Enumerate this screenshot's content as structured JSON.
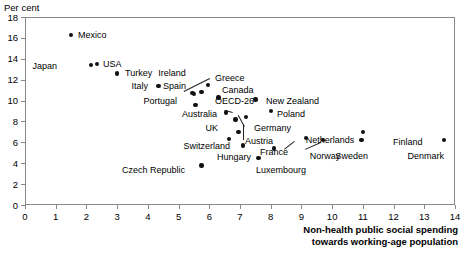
{
  "chart_data": {
    "type": "scatter",
    "title": "",
    "ylabel": "Per cent",
    "xlabel": "Non-health public social spending towards working-age population",
    "xlabel_line1": "Non-health public social spending",
    "xlabel_line2": "towards working-age population",
    "xlim": [
      0,
      14
    ],
    "ylim": [
      0,
      18
    ],
    "xticks": [
      0,
      1,
      2,
      3,
      4,
      5,
      6,
      7,
      8,
      9,
      10,
      11,
      12,
      13,
      14
    ],
    "yticks": [
      0,
      2,
      4,
      6,
      8,
      10,
      12,
      14,
      16,
      18
    ],
    "grid": false,
    "legend": "none",
    "marker_color": "#111111",
    "frame_color": "#888888",
    "points": [
      {
        "label": "Mexico",
        "x": 1.5,
        "y": 16.3,
        "lx": 78,
        "ly": 31,
        "align": "left"
      },
      {
        "label": "Japan",
        "x": 2.15,
        "y": 13.4,
        "lx": 57,
        "ly": 62,
        "align": "right"
      },
      {
        "label": "USA",
        "x": 2.35,
        "y": 13.5,
        "lx": 103,
        "ly": 60,
        "align": "left"
      },
      {
        "label": "Turkey",
        "x": 3.0,
        "y": 12.6,
        "lx": 125,
        "ly": 69,
        "align": "left"
      },
      {
        "label": "Italy",
        "x": 4.35,
        "y": 11.4,
        "lx": 148,
        "ly": 82,
        "align": "right"
      },
      {
        "label": "Ireland",
        "x": 5.45,
        "y": 10.7,
        "lx": 172,
        "ly": 69,
        "align": "center"
      },
      {
        "label": "Spain",
        "x": 5.5,
        "y": 10.6,
        "lx": 186,
        "ly": 82,
        "align": "right"
      },
      {
        "label": "Greece",
        "x": 5.95,
        "y": 11.5,
        "lx": 215,
        "ly": 74,
        "align": "left"
      },
      {
        "label": "Canada",
        "x": 5.75,
        "y": 10.8,
        "lx": 222,
        "ly": 86,
        "align": "left"
      },
      {
        "label": "Portugal",
        "x": 5.55,
        "y": 9.55,
        "lx": 177,
        "ly": 97,
        "align": "right"
      },
      {
        "label": "OECD-26",
        "x": 6.3,
        "y": 10.3,
        "lx": 215,
        "ly": 97,
        "align": "left"
      },
      {
        "label": "Australia",
        "x": 6.55,
        "y": 8.85,
        "lx": 217,
        "ly": 110,
        "align": "right"
      },
      {
        "label": "New Zealand",
        "x": 7.5,
        "y": 10.1,
        "lx": 266,
        "ly": 97,
        "align": "left"
      },
      {
        "label": "Poland",
        "x": 8.0,
        "y": 9.0,
        "lx": 277,
        "ly": 110,
        "align": "left"
      },
      {
        "label": "UK",
        "x": 6.85,
        "y": 8.2,
        "lx": 218,
        "ly": 124,
        "align": "right"
      },
      {
        "label": "Germany",
        "x": 7.2,
        "y": 8.45,
        "lx": 254,
        "ly": 124,
        "align": "left"
      },
      {
        "label": "Austria",
        "x": 6.95,
        "y": 7.0,
        "lx": 245,
        "ly": 137,
        "align": "left"
      },
      {
        "label": "Switzerland",
        "x": 6.65,
        "y": 6.3,
        "lx": 230,
        "ly": 142,
        "align": "right"
      },
      {
        "label": "Hungary",
        "x": 7.1,
        "y": 5.7,
        "lx": 251,
        "ly": 153,
        "align": "right"
      },
      {
        "label": "France",
        "x": 8.1,
        "y": 5.4,
        "lx": 274,
        "ly": 148,
        "align": "center"
      },
      {
        "label": "Netherlands",
        "x": 9.15,
        "y": 6.4,
        "lx": 330,
        "ly": 136,
        "align": "center"
      },
      {
        "label": "Norway",
        "x": 9.7,
        "y": 6.2,
        "lx": 325,
        "ly": 152,
        "align": "center"
      },
      {
        "label": "Sweden",
        "x": 10.95,
        "y": 6.2,
        "lx": 368,
        "ly": 152,
        "align": "right"
      },
      {
        "label": "Finland",
        "x": 11.0,
        "y": 7.0,
        "lx": 393,
        "ly": 138,
        "align": "left"
      },
      {
        "label": "Denmark",
        "x": 13.65,
        "y": 6.2,
        "lx": 444,
        "ly": 152,
        "align": "right"
      },
      {
        "label": "Luxembourg",
        "x": 7.6,
        "y": 4.5,
        "lx": 281,
        "ly": 166,
        "align": "center"
      },
      {
        "label": "Czech Republic",
        "x": 5.75,
        "y": 3.8,
        "lx": 185,
        "ly": 166,
        "align": "right"
      }
    ],
    "leaders": [
      {
        "from_x": 210,
        "from_y": 79,
        "to_x": 184,
        "to_y": 92
      },
      {
        "from_x": 244,
        "from_y": 127,
        "to_x": 238,
        "to_y": 116
      },
      {
        "from_x": 243,
        "from_y": 140,
        "to_x": 243,
        "to_y": 124
      },
      {
        "from_x": 284,
        "from_y": 149,
        "to_x": 294,
        "to_y": 141
      },
      {
        "from_x": 321,
        "from_y": 143,
        "to_x": 305,
        "to_y": 150
      },
      {
        "from_x": 225,
        "from_y": 110,
        "to_x": 233,
        "to_y": 112
      }
    ]
  }
}
